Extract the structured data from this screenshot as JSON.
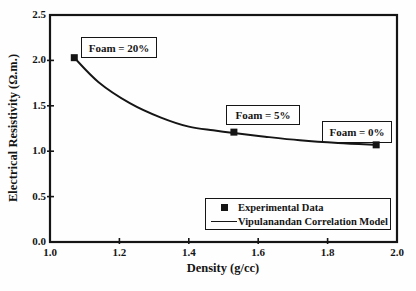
{
  "colors": {
    "ink": "#151515",
    "background": "#fefefe"
  },
  "chart_data": {
    "type": "line+scatter",
    "title": "",
    "xlabel": "Density (g/cc)",
    "ylabel": "Electrical Resistivity (Ω.m.)",
    "xlim": [
      1.0,
      2.0
    ],
    "ylim": [
      0.0,
      2.5
    ],
    "x_ticks": [
      "1.0",
      "1.2",
      "1.4",
      "1.6",
      "1.8",
      "2.0"
    ],
    "y_ticks": [
      "0.0",
      "0.5",
      "1.0",
      "1.5",
      "2.0",
      "2.5"
    ],
    "grid": false,
    "legend": {
      "position": "bottom-right"
    },
    "series": [
      {
        "name": "Experimental Data",
        "type": "scatter",
        "marker": "square",
        "x": [
          1.07,
          1.53,
          1.94
        ],
        "y": [
          2.03,
          1.21,
          1.07
        ]
      },
      {
        "name": "Vipulanandan Correlation Model",
        "type": "line",
        "x": [
          1.07,
          1.14,
          1.23,
          1.32,
          1.4,
          1.47,
          1.53,
          1.62,
          1.72,
          1.83,
          1.94
        ],
        "y": [
          2.03,
          1.76,
          1.53,
          1.37,
          1.27,
          1.23,
          1.2,
          1.16,
          1.12,
          1.09,
          1.07
        ]
      }
    ],
    "annotations": [
      {
        "label": "Foam = 20%",
        "x": 1.07,
        "y": 2.03
      },
      {
        "label": "Foam = 5%",
        "x": 1.53,
        "y": 1.21
      },
      {
        "label": "Foam = 0%",
        "x": 1.94,
        "y": 1.07
      }
    ]
  }
}
